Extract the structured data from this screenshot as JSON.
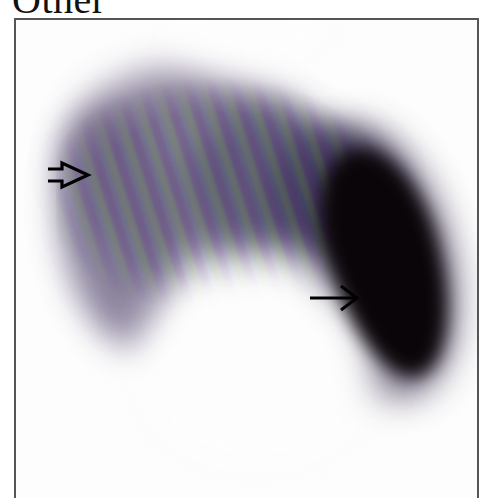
{
  "figure": {
    "label": "Other",
    "colors": {
      "background": "#ffffff",
      "frame_border": "#555555",
      "liver_tone": "#6e6384",
      "spleen_tone": "#0a0508",
      "arrow": "#000000"
    },
    "annotations": [
      {
        "type": "open-arrowhead",
        "pointing": "right",
        "target": "liver-left-margin",
        "position": {
          "x": 52,
          "y": 172
        }
      },
      {
        "type": "line-arrow",
        "pointing": "right",
        "target": "spleen",
        "position": {
          "x": 330,
          "y": 296
        }
      }
    ]
  }
}
